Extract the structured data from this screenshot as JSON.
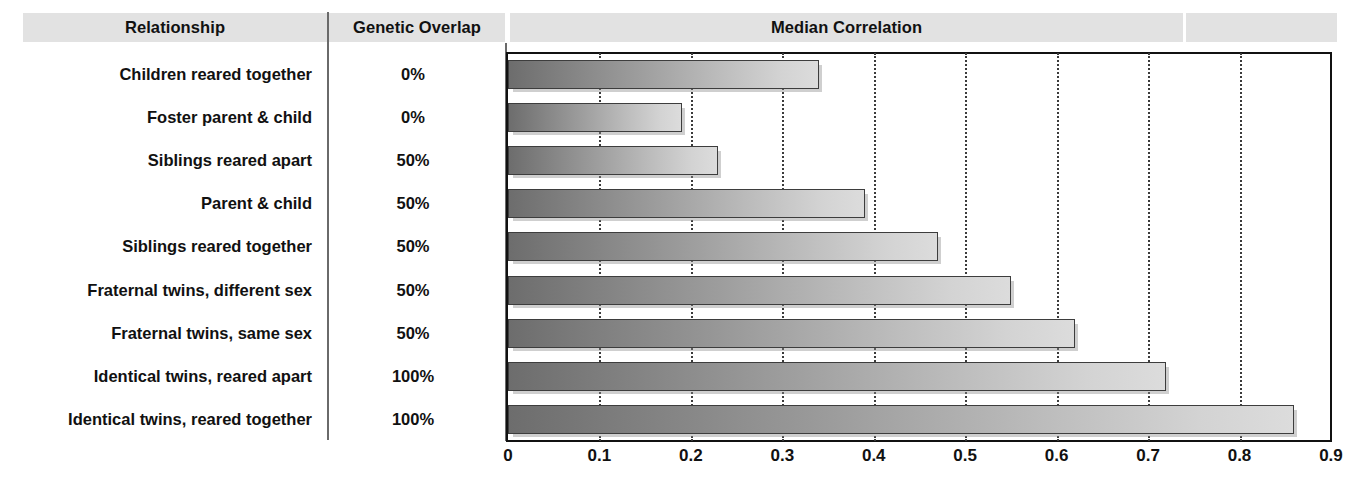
{
  "header": {
    "relationship": "Relationship",
    "genetic_overlap": "Genetic Overlap",
    "median_correlation": "Median Correlation"
  },
  "rows": [
    {
      "relationship": "Children reared together",
      "genetic_overlap": "0%",
      "median_correlation": 0.34
    },
    {
      "relationship": "Foster parent & child",
      "genetic_overlap": "0%",
      "median_correlation": 0.19
    },
    {
      "relationship": "Siblings reared apart",
      "genetic_overlap": "50%",
      "median_correlation": 0.23
    },
    {
      "relationship": "Parent & child",
      "genetic_overlap": "50%",
      "median_correlation": 0.39
    },
    {
      "relationship": "Siblings reared together",
      "genetic_overlap": "50%",
      "median_correlation": 0.47
    },
    {
      "relationship": "Fraternal twins, different sex",
      "genetic_overlap": "50%",
      "median_correlation": 0.55
    },
    {
      "relationship": "Fraternal twins, same sex",
      "genetic_overlap": "50%",
      "median_correlation": 0.62
    },
    {
      "relationship": "Identical twins, reared apart",
      "genetic_overlap": "100%",
      "median_correlation": 0.72
    },
    {
      "relationship": "Identical twins, reared together",
      "genetic_overlap": "100%",
      "median_correlation": 0.86
    }
  ],
  "axis": {
    "ticks": [
      "0",
      "0.1",
      "0.2",
      "0.3",
      "0.4",
      "0.5",
      "0.6",
      "0.7",
      "0.8",
      "0.9"
    ],
    "min": 0,
    "max": 0.9,
    "step": 0.1
  },
  "colors": {
    "header_band": "#e2e2e2",
    "bar_dark": "#6d6d6d",
    "bar_light": "#dcdcdc",
    "bar_outline": "#3d3d3d",
    "gridline": "#3b3b3b",
    "text": "#111111"
  },
  "chart_data": {
    "type": "bar",
    "orientation": "horizontal",
    "title": "Median Correlation",
    "xlabel": "",
    "ylabel": "",
    "xlim": [
      0,
      0.9
    ],
    "grid": true,
    "legend": false,
    "categories": [
      "Children reared together",
      "Foster parent & child",
      "Siblings reared apart",
      "Parent & child",
      "Siblings reared together",
      "Fraternal twins, different sex",
      "Fraternal twins, same sex",
      "Identical twins, reared apart",
      "Identical twins, reared together"
    ],
    "values": [
      0.34,
      0.19,
      0.23,
      0.39,
      0.47,
      0.55,
      0.62,
      0.72,
      0.86
    ],
    "annotations": {
      "genetic_overlap": [
        "0%",
        "0%",
        "50%",
        "50%",
        "50%",
        "50%",
        "50%",
        "100%",
        "100%"
      ]
    },
    "xticks": [
      0,
      0.1,
      0.2,
      0.3,
      0.4,
      0.5,
      0.6,
      0.7,
      0.8,
      0.9
    ],
    "xticklabels": [
      "0",
      "0.1",
      "0.2",
      "0.3",
      "0.4",
      "0.5",
      "0.6",
      "0.7",
      "0.8",
      "0.9"
    ]
  }
}
